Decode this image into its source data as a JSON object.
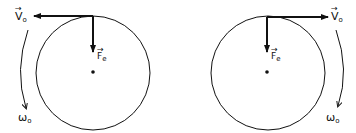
{
  "diagrams": [
    {
      "name": "left-rotation",
      "velocity_label": "V",
      "velocity_sub": "o",
      "force_label": "F",
      "force_sub": "e",
      "omega_label": "ω",
      "omega_sub": "o",
      "velocity_direction": "left",
      "rotation_direction": "counterclockwise"
    },
    {
      "name": "right-rotation",
      "velocity_label": "V",
      "velocity_sub": "o",
      "force_label": "F",
      "force_sub": "e",
      "omega_label": "ω",
      "omega_sub": "o",
      "velocity_direction": "right",
      "rotation_direction": "clockwise"
    }
  ],
  "colors": {
    "stroke": "#111111",
    "background": "#ffffff"
  }
}
